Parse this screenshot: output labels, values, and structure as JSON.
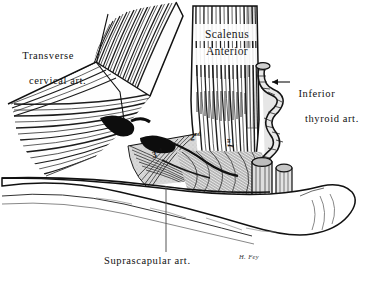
{
  "figure": {
    "style": "monochrome line engraving",
    "background_color": "#ffffff",
    "ink_color": "#1a1a1a",
    "signature": "H. Fey"
  },
  "labels": {
    "transverse_cervical": {
      "line1": "Transverse",
      "line2": "cervical art."
    },
    "inferior_thyroid": {
      "line1": "Inferior",
      "line2": "thyroid art."
    },
    "suprascapular": {
      "text": "Suprascapular art."
    },
    "scalenus": {
      "line1": "Scalenus",
      "line2": "Anterior"
    }
  },
  "rib_markers": [
    {
      "id": "third-rib",
      "number": "3",
      "ordinal": "rd"
    },
    {
      "id": "second-rib",
      "number": "2",
      "ordinal": "nd"
    },
    {
      "id": "first-rib",
      "number": "1",
      "ordinal": "st"
    }
  ],
  "structures": {
    "clavicle": "clavicle",
    "scalenus_anterior": "scalenus anterior muscle",
    "omohyoid": "omohyoid muscle",
    "vessel_stumps": "cut subclavian vessel stumps",
    "inferior_thyroid_coil": "inferior thyroid artery coil"
  },
  "leaders": {
    "transverse_cervical": "pointer line to dark artery",
    "inferior_thyroid": "left arrow to coiled vessel",
    "suprascapular": "vertical pointer line upward"
  }
}
